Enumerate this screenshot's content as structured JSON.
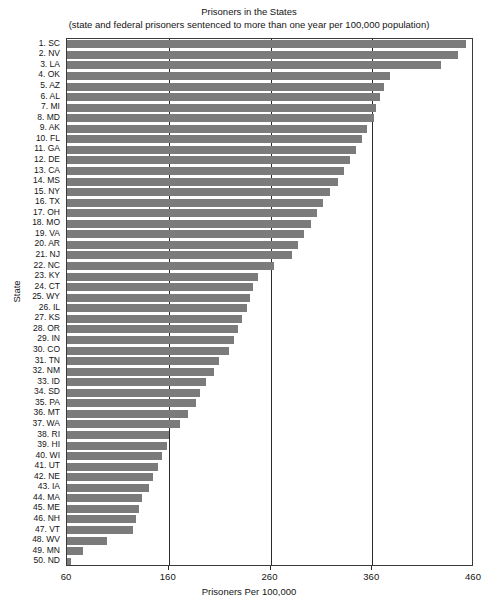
{
  "chart_data": {
    "type": "bar",
    "orientation": "horizontal",
    "title": "Prisoners in the States",
    "subtitle": "(state and federal prisoners sentenced to more than one year per 100,000 population)",
    "xlabel": "Prisoners Per 100,000",
    "ylabel": "State",
    "xlim": [
      60,
      460
    ],
    "xticks": [
      60,
      160,
      260,
      360,
      460
    ],
    "xtick_labels": [
      "60",
      "160",
      "260",
      "360",
      "460"
    ],
    "grid": "vertical-at-xticks",
    "legend": null,
    "bar_color": "#7b7b7b",
    "frame_color": "#3a3a3a",
    "categories": [
      "1. SC",
      "2. NV",
      "3. LA",
      "4. OK",
      "5. AZ",
      "6. AL",
      "7. MI",
      "8. MD",
      "9. AK",
      "10. FL",
      "11. GA",
      "12. DE",
      "13. CA",
      "14. MS",
      "15. NY",
      "16. TX",
      "17. OH",
      "18. MO",
      "19. VA",
      "20. AR",
      "21. NJ",
      "22. NC",
      "23. KY",
      "24. CT",
      "25. WY",
      "26. IL",
      "27. KS",
      "28. OR",
      "29. IN",
      "30. CO",
      "31. TN",
      "32. NM",
      "33. ID",
      "34. SD",
      "35. PA",
      "36. MT",
      "37. WA",
      "38. RI",
      "39. HI",
      "40. WI",
      "41. UT",
      "42. NE",
      "43. IA",
      "44. MA",
      "45. ME",
      "46. NH",
      "47. VT",
      "48. WV",
      "49. MN",
      "50. ND"
    ],
    "values": [
      452,
      444,
      428,
      377,
      372,
      368,
      364,
      362,
      355,
      350,
      344,
      338,
      332,
      326,
      318,
      312,
      306,
      300,
      293,
      287,
      281,
      263,
      248,
      243,
      240,
      237,
      232,
      228,
      224,
      219,
      209,
      204,
      197,
      191,
      187,
      179,
      171,
      160,
      158,
      153,
      149,
      145,
      141,
      134,
      131,
      128,
      125,
      99,
      76,
      64
    ]
  }
}
